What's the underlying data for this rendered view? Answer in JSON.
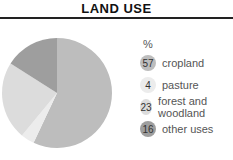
{
  "header": {
    "title": "LAND USE"
  },
  "legend": {
    "unit": "%"
  },
  "chart_data": {
    "type": "pie",
    "title": "LAND USE",
    "unit": "%",
    "categories": [
      "cropland",
      "pasture",
      "forest and woodland",
      "other uses"
    ],
    "values": [
      57,
      4,
      23,
      16
    ],
    "colors": [
      "#bdbdbd",
      "#ececec",
      "#dcdcdc",
      "#9e9e9e"
    ],
    "start_angle_deg": 0,
    "direction": "clockwise",
    "legend_position": "right"
  }
}
